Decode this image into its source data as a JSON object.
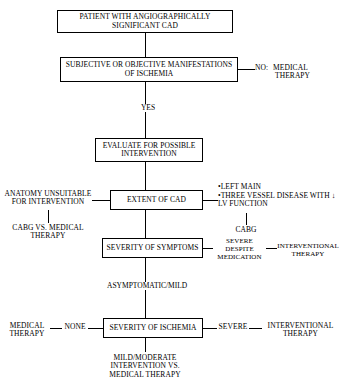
{
  "diagram": {
    "nodes": {
      "patient_cad": "PATIENT WITH ANGIOGRAPHICALLY SIGNIFICANT CAD",
      "manifestations": "SUBJECTIVE OR OBJECTIVE MANIFESTATIONS OF ISCHEMIA",
      "evaluate": "EVALUATE FOR POSSIBLE INTERVENTION",
      "extent_of_cad": "EXTENT OF CAD",
      "severity_symptoms": "SEVERITY OF SYMPTOMS",
      "severity_ischemia": "SEVERITY OF ISCHEMIA"
    },
    "branches": {
      "no_label": "NO:",
      "no_outcome_line1": "MEDICAL",
      "no_outcome_line2": "THERAPY",
      "yes_label": "YES",
      "anatomy_unsuitable": "ANATOMY UNSUITABLE FOR INTERVENTION",
      "cabg_vs_medical": "CABG VS. MEDICAL THERAPY",
      "high_risk_bullet_1": "LEFT MAIN",
      "high_risk_bullet_2": "THREE VESSEL DISEASE WITH ↓ LV FUNCTION",
      "cabg": "CABG",
      "severe_despite_medication": "SEVERE DESPITE MEDICATION",
      "interventional_therapy_symptoms": "INTERVENTIONAL THERAPY",
      "asymptomatic_mild": "ASYMPTOMATIC/MILD",
      "none_label": "NONE",
      "medical_therapy_none": "MEDICAL THERAPY",
      "severe_label": "SEVERE",
      "interventional_therapy_ischemia": "INTERVENTIONAL THERAPY",
      "mild_moderate_outcome": "MILD/MODERATE INTERVENTION VS. MEDICAL THERAPY"
    },
    "colors": {
      "stroke": "#000000",
      "background": "#ffffff"
    }
  }
}
